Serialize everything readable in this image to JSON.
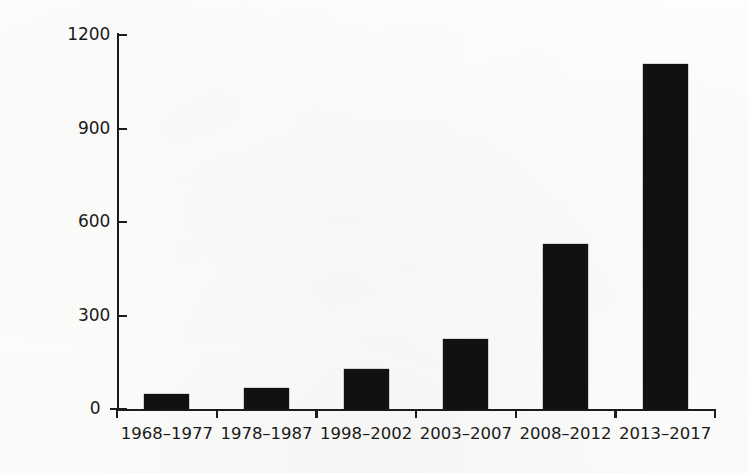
{
  "chart_data": {
    "type": "bar",
    "title": "",
    "subtitle": "",
    "xlabel": "",
    "ylabel": "Number of articles published",
    "categories": [
      "1968–1977",
      "1978–1987",
      "1998–2002",
      "2003–2007",
      "2008–2012",
      "2013–2017"
    ],
    "values": [
      48,
      67,
      127,
      225,
      530,
      1107
    ],
    "ylim": [
      0,
      1200
    ],
    "yticks": [
      0,
      300,
      600,
      900,
      1200
    ],
    "ytick_labels": [
      "0",
      "300",
      "600",
      "900",
      "1200"
    ],
    "grid": false,
    "legend": false,
    "legend_position": "none",
    "series": [
      {
        "name": "Articles published",
        "values": [
          48,
          67,
          127,
          225,
          530,
          1107
        ]
      }
    ],
    "colors": {
      "bar": "#111111",
      "axis": "#1b1b1b",
      "text": "#1a1a1a",
      "background": "#fdfdfc"
    },
    "annotations": []
  }
}
